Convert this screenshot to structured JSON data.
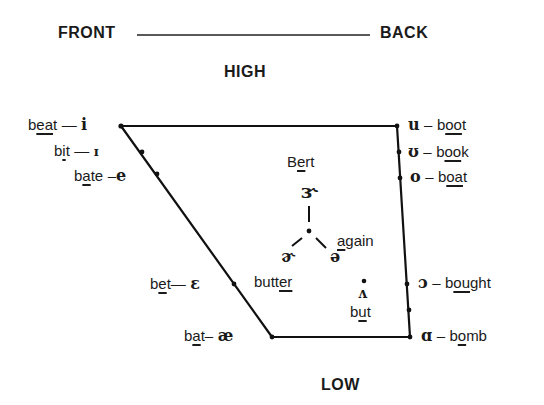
{
  "axes": {
    "front": "FRONT",
    "back": "BACK",
    "high": "HIGH",
    "low": "LOW"
  },
  "front_vowels": [
    {
      "symbol": "i",
      "word_pre": "b",
      "word_hl": "ea",
      "word_post": "t",
      "dash": "—"
    },
    {
      "symbol": "ɪ",
      "word_pre": "b",
      "word_hl": "i",
      "word_post": "t",
      "dash": "—"
    },
    {
      "symbol": "e",
      "word_pre": "b",
      "word_hl": "a",
      "word_post": "te",
      "dash": "–"
    },
    {
      "symbol": "ɛ",
      "word_pre": "b",
      "word_hl": "e",
      "word_post": "t",
      "dash": "—"
    },
    {
      "symbol": "æ",
      "word_pre": "b",
      "word_hl": "a",
      "word_post": "t",
      "dash": "–"
    }
  ],
  "back_vowels": [
    {
      "symbol": "u",
      "word_pre": "b",
      "word_hl": "oo",
      "word_post": "t",
      "dash": "–"
    },
    {
      "symbol": "ʊ",
      "word_pre": "b",
      "word_hl": "oo",
      "word_post": "k",
      "dash": "–"
    },
    {
      "symbol": "o",
      "word_pre": "b",
      "word_hl": "oa",
      "word_post": "t",
      "dash": "–"
    },
    {
      "symbol": "ɔ",
      "word_pre": "b",
      "word_hl": "ou",
      "word_post": "ght",
      "dash": "–"
    },
    {
      "symbol": "ɑ",
      "word_pre": "b",
      "word_hl": "o",
      "word_post": "mb",
      "dash": "–"
    }
  ],
  "central_vowels": {
    "bert": {
      "symbol": "ɝ",
      "word_pre": "B",
      "word_hl": "e",
      "word_post": "rt"
    },
    "butter": {
      "symbol": "ɚ",
      "word_pre": "butt",
      "word_hl": "er",
      "word_post": ""
    },
    "again": {
      "symbol": "ə",
      "word_pre": "",
      "word_hl": "a",
      "word_post": "gain"
    },
    "but": {
      "symbol": "ʌ",
      "word_pre": "b",
      "word_hl": "u",
      "word_post": "t"
    }
  }
}
